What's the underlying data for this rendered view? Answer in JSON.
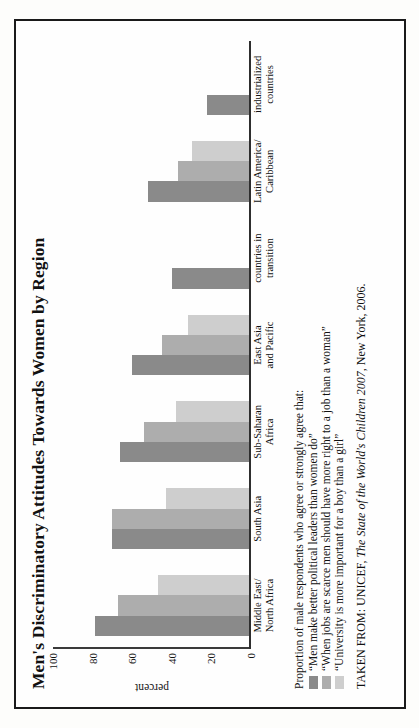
{
  "figure": {
    "title": "Men's Discriminatory Attitudes Towards Women by Region",
    "source_prefix": "TAKEN FROM: UNICEF, ",
    "source_italic": "The State of the World's Children 2007",
    "source_suffix": ", New York, 2006.",
    "legend_title": "Proportion of male respondents who agree or strongly agree that:"
  },
  "chart_data": {
    "type": "bar",
    "orientation": "vertical",
    "title": "Men's Discriminatory Attitudes Towards Women by Region",
    "xlabel": "",
    "ylabel": "percent",
    "ylim": [
      0,
      100
    ],
    "yticks": [
      0,
      20,
      40,
      60,
      80,
      100
    ],
    "ytick_labels": [
      "0",
      "20",
      "40",
      "60",
      "80",
      "100"
    ],
    "grid": false,
    "legend_position": "below-plot-left",
    "categories": [
      "Middle East/\nNorth Africa",
      "South Asia",
      "Sub-Saharan\nAfrica",
      "East Asia\nand Pacific",
      "countries in\ntransition",
      "Latin America/\nCaribbean",
      "industrialized\ncountries"
    ],
    "category_labels": [
      [
        "Middle East/",
        "North Africa"
      ],
      [
        "South Asia",
        ""
      ],
      [
        "Sub-Saharan",
        "Africa"
      ],
      [
        "East Asia",
        "and Pacific"
      ],
      [
        "countries in",
        "transition"
      ],
      [
        "Latin America/",
        "Caribbean"
      ],
      [
        "industrialized",
        "countries"
      ]
    ],
    "series": [
      {
        "name": "“Men make better political leaders than women do”",
        "color": "#8a8a8a",
        "values": [
          79,
          70,
          66,
          60,
          40,
          52,
          22
        ]
      },
      {
        "name": "“When jobs are scarce men should have more right to a job than a woman”",
        "color": "#adadad",
        "values": [
          67,
          70,
          54,
          45,
          null,
          37,
          null
        ]
      },
      {
        "name": "“University is more important for a boy than a girl”",
        "color": "#cecece",
        "values": [
          47,
          43,
          38,
          32,
          null,
          30,
          null
        ]
      }
    ]
  }
}
